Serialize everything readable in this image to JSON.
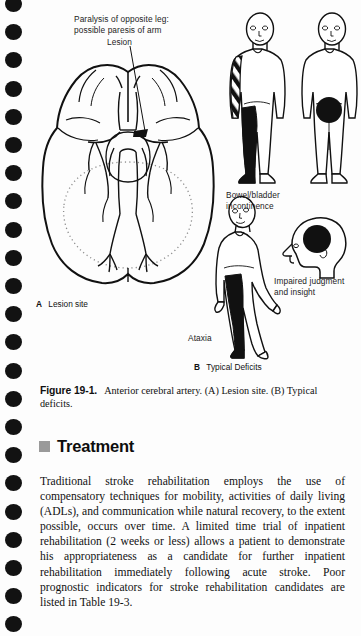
{
  "page": {
    "background_color": "#fdfdfd",
    "ink_color": "#111111",
    "binding": {
      "hole_count": 23,
      "hole_color": "#121212"
    }
  },
  "figure": {
    "panel_a": {
      "label_letter": "A",
      "label_text": "Lesion site",
      "callout": "Lesion",
      "description": "Inferior view of the brain showing the circle of Willis with lesion marked on the anterior cerebral artery"
    },
    "panel_b": {
      "label_letter": "B",
      "label_text": "Typical Deficits",
      "deficits": [
        {
          "name": "paralysis-of-opposite-leg",
          "text": "Paralysis of opposite leg:\npossible paresis of arm"
        },
        {
          "name": "bowel-bladder-incontinence",
          "text": "Bowel/bladder\nincontinence"
        },
        {
          "name": "impaired-judgment",
          "text": "Impaired judgment\nand insight"
        },
        {
          "name": "ataxia",
          "text": "Ataxia"
        }
      ]
    }
  },
  "caption": {
    "figure_number": "Figure 19-1.",
    "text": "Anterior cerebral artery. (A) Lesion site. (B) Typical deficits."
  },
  "section": {
    "heading": "Treatment",
    "bullet_color": "#9a9a9a",
    "paragraph": "Traditional stroke rehabilitation employs the use of compensatory techniques for mobility, activities of daily living (ADLs), and communication while natural recovery, to the extent possible, occurs over time. A limited time trial of inpatient rehabilitation (2 weeks or less) allows a patient to demonstrate his appropriateness as a candidate for further inpatient rehabilitation immediately following acute stroke. Poor prognostic indicators for stroke rehabilitation candidates are listed in Table 19-3.",
    "paragraph_last_line": "dates are listed in Table 19-3."
  }
}
